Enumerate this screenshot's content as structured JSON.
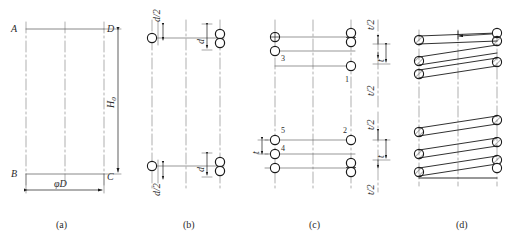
{
  "figure": {
    "type": "engineering-drawing",
    "panels": [
      {
        "id": "a",
        "caption": "(a)",
        "description": "Outline rectangle of the spring envelope with corner points and overall dimensions",
        "corner_labels": [
          "A",
          "D",
          "B",
          "C"
        ],
        "dimensions": [
          {
            "label": "H",
            "subscript": "0",
            "orientation": "vertical",
            "meaning": "free height"
          },
          {
            "label": "φD",
            "orientation": "horizontal",
            "meaning": "mean coil diameter"
          }
        ],
        "centerlines": 3
      },
      {
        "id": "b",
        "caption": "(b)",
        "description": "Wire cross-section circles placed at the ends, set out by half and full wire diameter",
        "dimensions": [
          {
            "label": "d/2",
            "position": "top-left"
          },
          {
            "label": "d",
            "position": "top-right"
          },
          {
            "label": "d/2",
            "position": "bottom-left"
          },
          {
            "label": "d",
            "position": "bottom-right"
          }
        ],
        "circle_count": 6
      },
      {
        "id": "c",
        "caption": "(c)",
        "description": "Intermediate coil sections numbered in drawing order, spaced by the pitch",
        "numbered_circles": [
          "1",
          "2",
          "3",
          "4",
          "5"
        ],
        "dimensions": [
          {
            "label": "t/2",
            "position": "upper-right-top"
          },
          {
            "label": "t",
            "position": "upper-right-middle"
          },
          {
            "label": "t/2",
            "position": "upper-right-bottom"
          },
          {
            "label": "t",
            "position": "lower-left"
          },
          {
            "label": "t/2",
            "position": "lower-right-top"
          },
          {
            "label": "t",
            "position": "lower-right-middle"
          },
          {
            "label": "t/2",
            "position": "lower-right-bottom"
          }
        ]
      },
      {
        "id": "d",
        "caption": "(d)",
        "description": "Finished spring view with hatched wire sections joined by tangent coil lines",
        "hatched_sections": 11,
        "coil_groups": 2
      }
    ],
    "colors": {
      "outline": "#1a1a1a",
      "centerline": "#8c8c8c",
      "dimension": "#1a1a1a",
      "hatch": "#3a3a3a",
      "background": "#ffffff"
    }
  }
}
